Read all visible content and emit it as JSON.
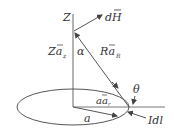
{
  "diagram": {
    "labels": {
      "z_axis": "Z",
      "dH": "dH",
      "z_vec": "Za",
      "z_vec_sub": "z",
      "alpha": "α",
      "r_vec": "Ra",
      "r_vec_sub": "R",
      "theta": "θ",
      "a_vec": "aa",
      "a_vec_sub": "r",
      "radius": "a",
      "current_element": "Idl"
    },
    "colors": {
      "line": "#555555",
      "text": "#333333",
      "background": "#ffffff"
    }
  }
}
